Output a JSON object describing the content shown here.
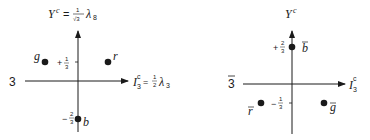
{
  "triplet": {
    "rep_label": "3",
    "y_axis_label": {
      "symbol": "Y",
      "sup": "c",
      "eq": "=",
      "frac_num": "1",
      "frac_den": "√3",
      "lambda": "λ",
      "lambda_sub": "8"
    },
    "x_axis_label": {
      "symbol": "I",
      "sub": "3",
      "sup": "c",
      "eq": "=",
      "frac_num": "1",
      "frac_den": "2",
      "lambda": "λ",
      "lambda_sub": "3"
    },
    "ticks": {
      "upper": {
        "sign": "+",
        "num": "1",
        "den": "3"
      },
      "lower": {
        "sign": "−",
        "num": "2",
        "den": "3"
      }
    },
    "points": [
      {
        "label": "g",
        "I3": "-1/2",
        "Y": "+1/3"
      },
      {
        "label": "r",
        "I3": "+1/2",
        "Y": "+1/3"
      },
      {
        "label": "b",
        "I3": "0",
        "Y": "-2/3"
      }
    ]
  },
  "antitriplet": {
    "rep_label": "3",
    "rep_bar": true,
    "y_axis_label": {
      "symbol": "Y",
      "sup": "c"
    },
    "x_axis_label": {
      "symbol": "I",
      "sub": "3",
      "sup": "c"
    },
    "ticks": {
      "upper": {
        "sign": "+",
        "num": "2",
        "den": "3"
      },
      "lower": {
        "sign": "−",
        "num": "1",
        "den": "3"
      }
    },
    "points": [
      {
        "label": "b",
        "bar": true,
        "I3": "0",
        "Y": "+2/3"
      },
      {
        "label": "r",
        "bar": true,
        "I3": "-1/2",
        "Y": "-1/3"
      },
      {
        "label": "g",
        "bar": true,
        "I3": "+1/2",
        "Y": "-1/3"
      }
    ]
  },
  "colors": {
    "ink": "#1a1a1a",
    "background": "#ffffff"
  }
}
